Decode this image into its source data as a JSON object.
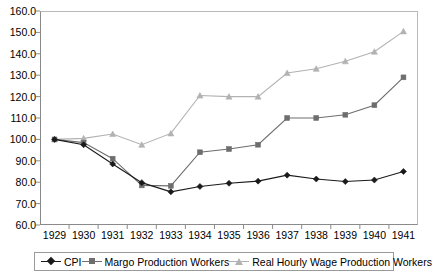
{
  "chart_data": {
    "type": "line",
    "title": "",
    "xlabel": "",
    "ylabel": "",
    "categories": [
      "1929",
      "1930",
      "1931",
      "1932",
      "1933",
      "1934",
      "1935",
      "1936",
      "1937",
      "1938",
      "1939",
      "1940",
      "1941"
    ],
    "ylim": [
      60.0,
      160.0
    ],
    "ytick_step": 10.0,
    "yticks": [
      "160.0",
      "150.0",
      "140.0",
      "130.0",
      "120.0",
      "110.0",
      "100.0",
      "90.0",
      "80.0",
      "70.0",
      "60.0"
    ],
    "grid": false,
    "legend_position": "bottom",
    "series": [
      {
        "name": "CPI",
        "color": "#1a1a1a",
        "marker": "diamond",
        "values": [
          100.0,
          97.5,
          88.5,
          79.8,
          75.5,
          78.0,
          79.5,
          80.5,
          83.3,
          81.5,
          80.3,
          81.0,
          85.0
        ]
      },
      {
        "name": "Margo Production Workers",
        "color": "#6e6e6e",
        "marker": "square",
        "values": [
          100.0,
          98.5,
          91.0,
          78.5,
          78.3,
          94.0,
          95.5,
          97.5,
          110.0,
          110.0,
          111.5,
          116.0,
          129.0
        ]
      },
      {
        "name": "Real Hourly Wage Production Workers",
        "color": "#b2b2b2",
        "marker": "triangle",
        "values": [
          100.0,
          100.5,
          102.5,
          97.5,
          102.8,
          120.5,
          120.0,
          120.0,
          131.0,
          133.0,
          136.5,
          141.0,
          150.5
        ]
      }
    ]
  },
  "legend": {
    "items": [
      {
        "label": "CPI"
      },
      {
        "label": "Margo Production Workers"
      },
      {
        "label": "Real Hourly Wage Production Workers"
      }
    ]
  }
}
